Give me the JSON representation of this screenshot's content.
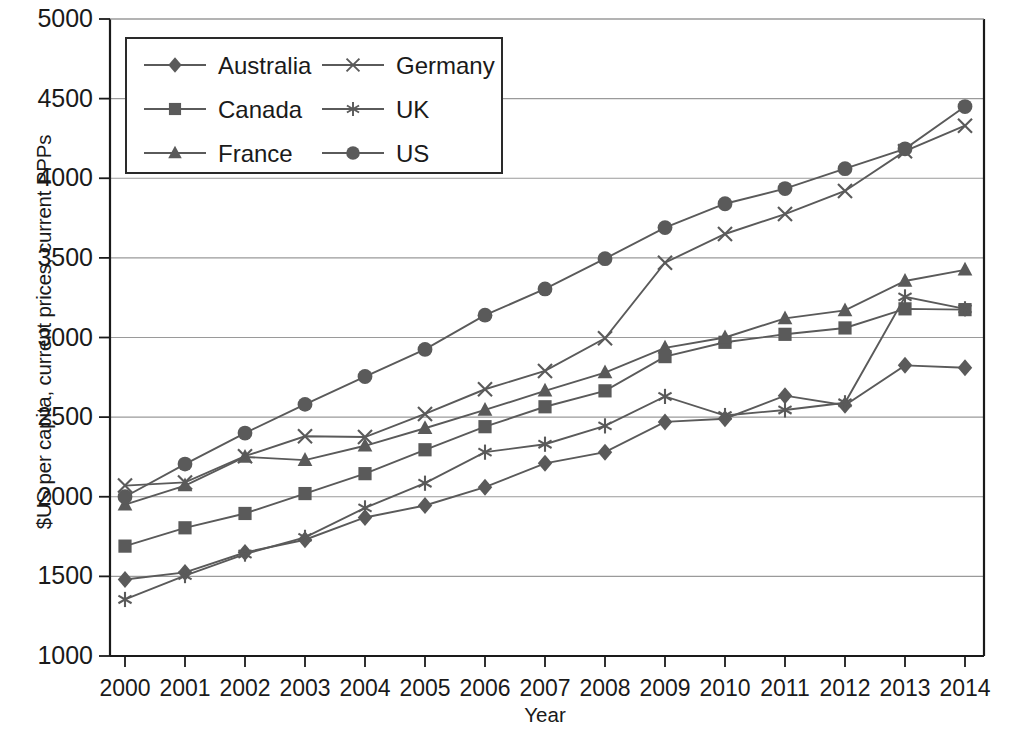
{
  "chart_data": {
    "type": "line",
    "title": "",
    "xlabel": "Year",
    "ylabel": "$US per capita, current prices, current PPPs",
    "xlim": [
      2000,
      2014
    ],
    "ylim": [
      1000,
      5000
    ],
    "ytick_step": 500,
    "grid": true,
    "legend_position": "top-left-inside",
    "x": [
      2000,
      2001,
      2002,
      2003,
      2004,
      2005,
      2006,
      2007,
      2008,
      2009,
      2010,
      2011,
      2012,
      2013,
      2014
    ],
    "categories": [
      "2000",
      "2001",
      "2002",
      "2003",
      "2004",
      "2005",
      "2006",
      "2007",
      "2008",
      "2009",
      "2010",
      "2011",
      "2012",
      "2013",
      "2014"
    ],
    "yticks": [
      "1000",
      "1500",
      "2000",
      "2500",
      "3000",
      "3500",
      "4000",
      "4500",
      "5000"
    ],
    "series": [
      {
        "name": "Australia",
        "marker": "diamond",
        "color": "#5a5a5a",
        "values": [
          1480,
          1525,
          1650,
          1730,
          1870,
          1945,
          2060,
          2210,
          2280,
          2470,
          2490,
          2635,
          2575,
          2825,
          2810
        ]
      },
      {
        "name": "Canada",
        "marker": "square",
        "color": "#5a5a5a",
        "values": [
          1690,
          1805,
          1895,
          2020,
          2145,
          2295,
          2440,
          2565,
          2665,
          2880,
          2970,
          3020,
          3060,
          3180,
          3175
        ]
      },
      {
        "name": "France",
        "marker": "triangle",
        "color": "#5a5a5a",
        "values": [
          1950,
          2070,
          2250,
          2230,
          2320,
          2430,
          2545,
          2665,
          2780,
          2935,
          3000,
          3120,
          3170,
          3355,
          3425
        ]
      },
      {
        "name": "Germany",
        "marker": "x",
        "color": "#5a5a5a",
        "values": [
          2070,
          2090,
          2255,
          2380,
          2375,
          2520,
          2675,
          2790,
          2995,
          3470,
          3650,
          3775,
          3920,
          4170,
          4330
        ]
      },
      {
        "name": "UK",
        "marker": "asterisk",
        "color": "#5a5a5a",
        "values": [
          1355,
          1505,
          1640,
          1745,
          1930,
          2085,
          2280,
          2330,
          2445,
          2630,
          2510,
          2545,
          2590,
          3255,
          3180
        ]
      },
      {
        "name": "US",
        "marker": "circle",
        "color": "#5a5a5a",
        "values": [
          2000,
          2205,
          2400,
          2580,
          2755,
          2925,
          3140,
          3305,
          3495,
          3690,
          3840,
          3935,
          4060,
          4185,
          4450
        ]
      }
    ]
  },
  "legend": {
    "entries": [
      {
        "label": "Australia",
        "marker": "diamond"
      },
      {
        "label": "Germany",
        "marker": "x"
      },
      {
        "label": "Canada",
        "marker": "square"
      },
      {
        "label": "UK",
        "marker": "asterisk"
      },
      {
        "label": "France",
        "marker": "triangle"
      },
      {
        "label": "US",
        "marker": "circle"
      }
    ]
  },
  "style": {
    "line_color": "#5a5a5a",
    "grid_color": "#9a9a9a",
    "axis_color": "#1a1a1a",
    "text_color": "#1a1a1a",
    "background": "#ffffff"
  }
}
